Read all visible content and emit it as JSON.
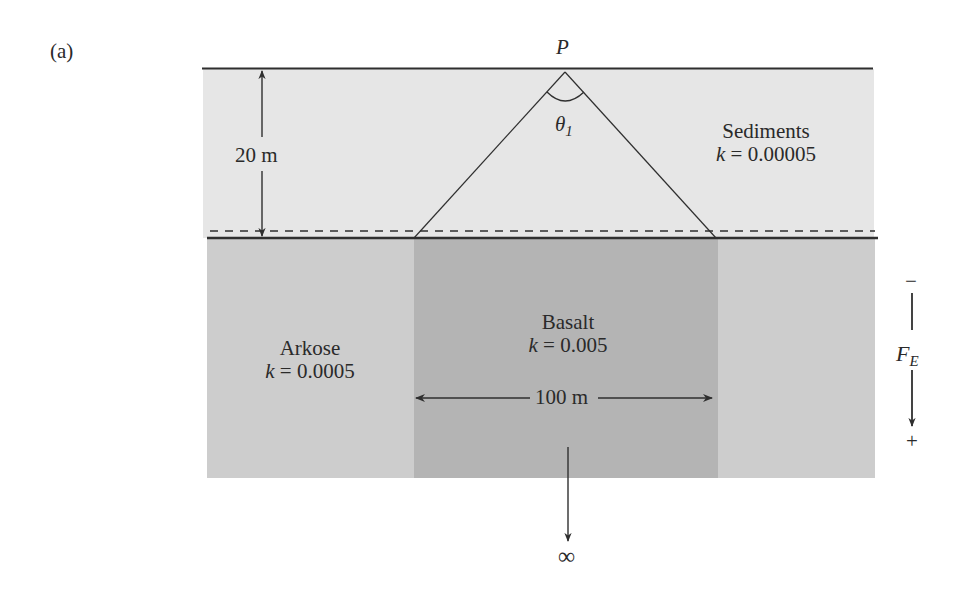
{
  "figure": {
    "panel_label": "(a)",
    "point_label": "P",
    "angle_label": "θ",
    "angle_subscript": "1",
    "depth_dimension": "20 m",
    "width_dimension": "100 m",
    "infinity_symbol": "∞",
    "field_axis": {
      "minus": "−",
      "plus": "+",
      "symbol": "F",
      "subscript": "E"
    }
  },
  "layers": [
    {
      "name": "Sediments",
      "k_symbol": "k",
      "k_value": "= 0.00005",
      "color": "#e6e6e6"
    },
    {
      "name": "Arkose",
      "k_symbol": "k",
      "k_value": "= 0.0005",
      "color": "#cdcdcd"
    },
    {
      "name": "Basalt",
      "k_symbol": "k",
      "k_value": "= 0.005",
      "color": "#b4b4b4"
    }
  ],
  "colors": {
    "line": "#2f2f2f",
    "background": "#ffffff"
  }
}
